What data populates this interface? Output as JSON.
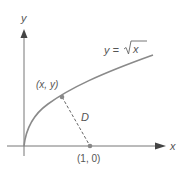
{
  "diagram": {
    "axes": {
      "x_label": "x",
      "y_label": "y"
    },
    "curve": {
      "equation_prefix": "y = ",
      "equation_radicand": "x",
      "color": "#8a8a8a"
    },
    "points": [
      {
        "id": "point-on-curve",
        "label": "(x, y)"
      },
      {
        "id": "point-fixed",
        "label": "(1, 0)"
      }
    ],
    "segment": {
      "label": "D",
      "style": "dashed"
    },
    "colors": {
      "axis": "#777777",
      "curve": "#8a8a8a",
      "point": "#888888",
      "text": "#555555"
    }
  }
}
